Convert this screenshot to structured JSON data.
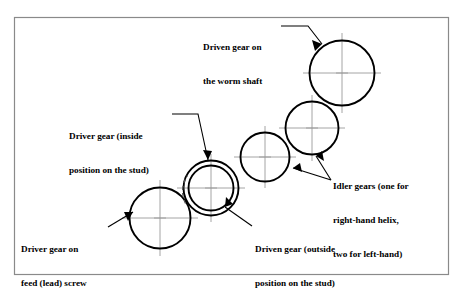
{
  "figure": {
    "name": "gear-train-diagram",
    "background_color": "#ffffff",
    "frame_color": "#8a8a8a",
    "line_color": "#000000",
    "center_mark_color": "#9a9a9a"
  },
  "labels": {
    "driven_worm": {
      "line1": "Driven gear on",
      "line2": "the worm shaft"
    },
    "driver_inside": {
      "line1": "Driver gear (inside",
      "line2": "position on the stud)"
    },
    "idler_gears": {
      "line1": "Idler gears (one for",
      "line2": "right-hand helix,",
      "line3": "two for left-hand)"
    },
    "driver_feed": {
      "line1": "Driver gear on",
      "line2": "feed (lead) screw"
    },
    "driven_outside": {
      "line1": "Driven gear (outside",
      "line2": "position on the stud)"
    }
  },
  "gears": [
    {
      "id": "driver-feed-screw-gear",
      "label_ref": "driver_feed",
      "cx": 160,
      "cy": 218,
      "r": 30.5,
      "concentric": false
    },
    {
      "id": "stud-gear-outer-driver-inside",
      "label_ref": "driver_inside",
      "cx": 211,
      "cy": 188,
      "r": 27.5,
      "concentric": true
    },
    {
      "id": "stud-gear-inner-driven-outside",
      "label_ref": "driven_outside",
      "cx": 211,
      "cy": 188,
      "r": 22.5,
      "concentric": true
    },
    {
      "id": "idler-gear-lower",
      "label_ref": "idler_gears",
      "cx": 265,
      "cy": 157,
      "r": 24.5,
      "concentric": false
    },
    {
      "id": "idler-gear-upper",
      "label_ref": "idler_gears",
      "cx": 312,
      "cy": 128,
      "r": 26.5,
      "concentric": false
    },
    {
      "id": "driven-worm-shaft-gear",
      "label_ref": "driven_worm",
      "cx": 342,
      "cy": 73,
      "r": 32.5,
      "concentric": false
    }
  ],
  "frame": {
    "x": 14,
    "y": 17,
    "width": 435,
    "height": 258
  }
}
